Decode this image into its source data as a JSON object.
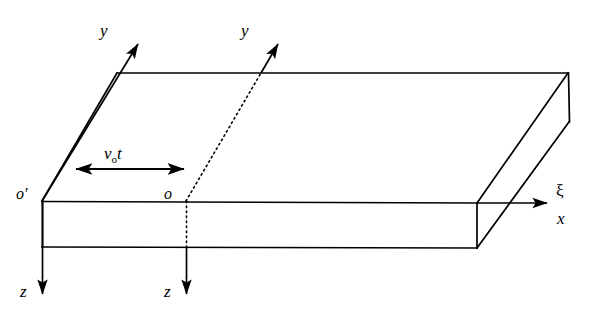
{
  "figure": {
    "kind": "oblique-projection-slab-with-two-frames",
    "background_color": "#ffffff",
    "line_color": "#000000",
    "width": 601,
    "height": 316
  },
  "labels": {
    "y_axis_primed": "y",
    "y_axis_moving": "y",
    "z_axis_primed": "z",
    "z_axis_moving": "z",
    "x_axis": "x",
    "xi_axis": "ξ",
    "origin_primed": "o′",
    "origin_moving": "o",
    "displacement_v": "v",
    "displacement_sub": "o",
    "displacement_t": "t",
    "displacement_full": "vₒt"
  },
  "geometry": {
    "slab_front_top_left": [
      42,
      201
    ],
    "slab_front_top_right": [
      477,
      203
    ],
    "slab_front_bottom_left": [
      42,
      247
    ],
    "slab_front_bottom_right": [
      477,
      248
    ],
    "slab_back_top_left": [
      117,
      73
    ],
    "slab_back_top_right": [
      568,
      74
    ],
    "slab_back_bottom_right": [
      570,
      122
    ],
    "origin_primed_point": [
      42,
      201
    ],
    "origin_moving_point": [
      186,
      201
    ],
    "y_primed_arrow_tip": [
      143,
      36
    ],
    "y_moving_arrow_tip": [
      283,
      36
    ],
    "z_primed_arrow_tip": [
      42,
      300
    ],
    "z_moving_arrow_tip": [
      186,
      300
    ],
    "x_arrow_tip": [
      553,
      203
    ],
    "displacement_arrow_from": [
      70,
      169
    ],
    "displacement_arrow_to": [
      190,
      169
    ],
    "slab_thickness_px": 46,
    "frame_separation_px": 144
  }
}
